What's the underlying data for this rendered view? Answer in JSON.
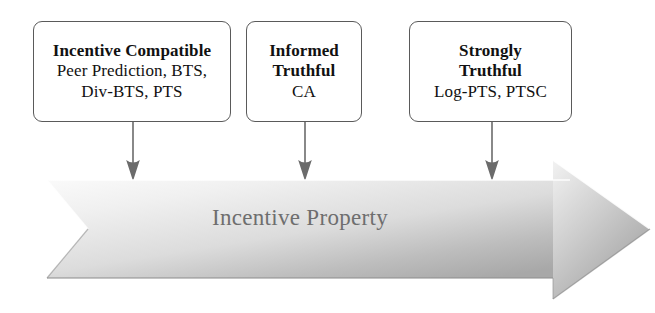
{
  "diagram": {
    "boxes": [
      {
        "title": "Incentive Compatible",
        "items": "Peer Prediction, BTS,",
        "items2": "Div-BTS, PTS"
      },
      {
        "title": "Informed",
        "title2": "Truthful",
        "items": "CA"
      },
      {
        "title": "Strongly",
        "title2": "Truthful",
        "items": "Log-PTS, PTSC"
      }
    ],
    "banner": {
      "label": "Incentive Property"
    },
    "colors": {
      "box_border": "#5a5a5a",
      "box_text": "#111111",
      "connector": "#6b6b6b",
      "banner_text": "#6e6e6e",
      "banner_light": "#f4f4f4",
      "banner_dark": "#adadad"
    }
  }
}
